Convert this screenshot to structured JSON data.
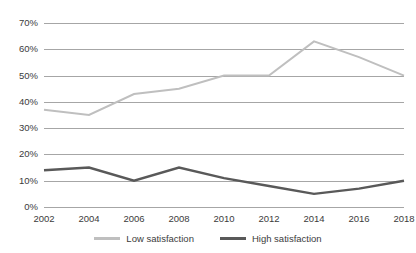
{
  "chart_data": {
    "type": "line",
    "title": "",
    "xlabel": "",
    "ylabel": "",
    "categories": [
      "2002",
      "2004",
      "2006",
      "2008",
      "2010",
      "2012",
      "2014",
      "2016",
      "2018"
    ],
    "x": [
      2002,
      2004,
      2006,
      2008,
      2010,
      2012,
      2014,
      2016,
      2018
    ],
    "ylim": [
      0,
      70
    ],
    "ytick_labels": [
      "0%",
      "10%",
      "20%",
      "30%",
      "40%",
      "50%",
      "60%",
      "70%"
    ],
    "ytick_values": [
      0,
      10,
      20,
      30,
      40,
      50,
      60,
      70
    ],
    "grid": "horizontal",
    "legend_position": "bottom-center",
    "series": [
      {
        "name": "Low satisfaction",
        "color": "#bfbfbf",
        "values": [
          37,
          35,
          43,
          45,
          50,
          50,
          63,
          57,
          50
        ]
      },
      {
        "name": "High satisfaction",
        "color": "#595959",
        "values": [
          14,
          15,
          10,
          15,
          11,
          8,
          5,
          7,
          10
        ]
      }
    ]
  },
  "legend": {
    "items": [
      {
        "label": "Low satisfaction",
        "color": "#bfbfbf"
      },
      {
        "label": "High satisfaction",
        "color": "#595959"
      }
    ]
  },
  "axes": {
    "gridline_color": "#a6a6a6"
  }
}
